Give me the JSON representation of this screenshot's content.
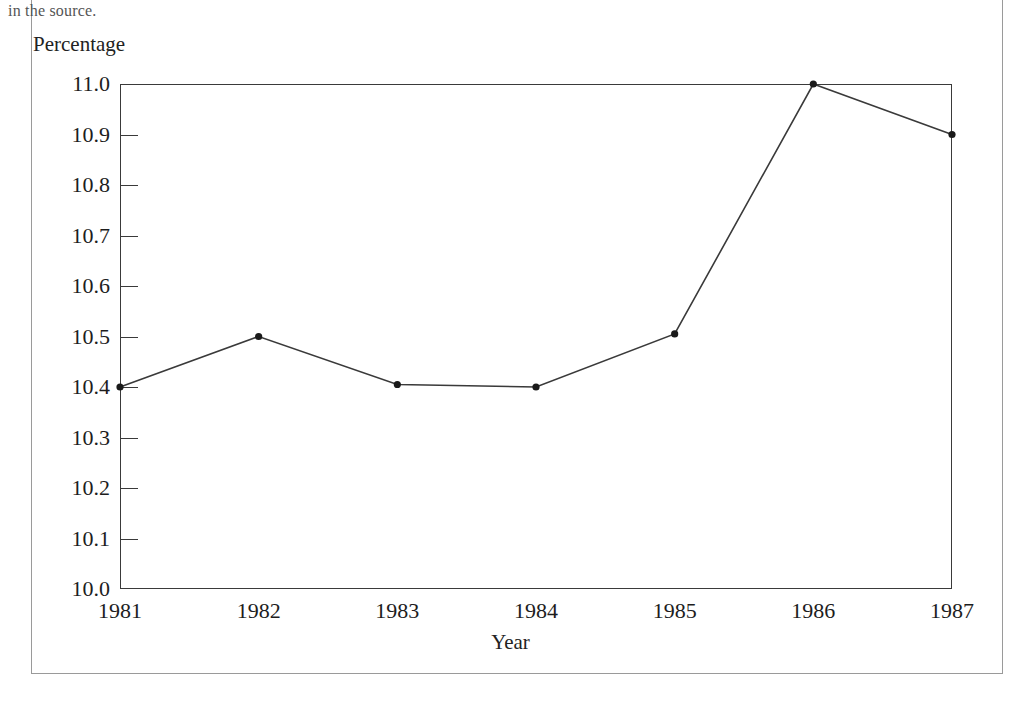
{
  "page": {
    "clipped_caption": "in the source."
  },
  "chart_data": {
    "type": "line",
    "title": "",
    "xlabel": "Year",
    "ylabel": "Percentage",
    "categories": [
      "1981",
      "1982",
      "1983",
      "1984",
      "1985",
      "1986",
      "1987"
    ],
    "values": [
      10.4,
      10.5,
      10.405,
      10.4,
      10.505,
      11.0,
      10.9
    ],
    "series": [
      {
        "name": "Percentage",
        "values": [
          10.4,
          10.5,
          10.405,
          10.4,
          10.505,
          11.0,
          10.9
        ]
      }
    ],
    "ylim": [
      10.0,
      11.0
    ],
    "ytick_labels": [
      "11.0",
      "10.9",
      "10.8",
      "10.7",
      "10.6",
      "10.5",
      "10.4",
      "10.3",
      "10.2",
      "10.1",
      "10.0"
    ],
    "ytick_values": [
      11.0,
      10.9,
      10.8,
      10.7,
      10.6,
      10.5,
      10.4,
      10.3,
      10.2,
      10.1,
      10.0
    ],
    "xtick_labels": [
      "1981",
      "1982",
      "1983",
      "1984",
      "1985",
      "1986",
      "1987"
    ],
    "grid": false,
    "legend": "none",
    "line_color": "#3a3a3a",
    "marker_color": "#1a1a1a",
    "axis_color": "#3a3a3a",
    "frame_color": "#9a9a9a"
  }
}
